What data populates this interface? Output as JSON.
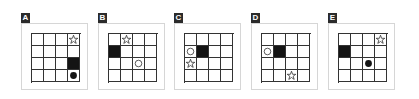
{
  "panels": [
    {
      "label": "A",
      "left": 21,
      "cells": [
        {
          "row": 0,
          "col": 3,
          "type": "star"
        },
        {
          "row": 2,
          "col": 3,
          "type": "black"
        },
        {
          "row": 3,
          "col": 3,
          "type": "dot"
        }
      ]
    },
    {
      "label": "B",
      "left": 98,
      "cells": [
        {
          "row": 0,
          "col": 1,
          "type": "star"
        },
        {
          "row": 1,
          "col": 0,
          "type": "black"
        },
        {
          "row": 2,
          "col": 2,
          "type": "circle"
        }
      ]
    },
    {
      "label": "C",
      "left": 174,
      "cells": [
        {
          "row": 1,
          "col": 0,
          "type": "circle"
        },
        {
          "row": 1,
          "col": 1,
          "type": "black"
        },
        {
          "row": 2,
          "col": 0,
          "type": "star"
        }
      ]
    },
    {
      "label": "D",
      "left": 251,
      "cells": [
        {
          "row": 1,
          "col": 0,
          "type": "circle"
        },
        {
          "row": 1,
          "col": 1,
          "type": "black"
        },
        {
          "row": 3,
          "col": 2,
          "type": "star"
        }
      ]
    },
    {
      "label": "E",
      "left": 328,
      "cells": [
        {
          "row": 0,
          "col": 3,
          "type": "star"
        },
        {
          "row": 1,
          "col": 0,
          "type": "black"
        },
        {
          "row": 2,
          "col": 2,
          "type": "dot"
        }
      ]
    }
  ],
  "grid": {
    "rows": 4,
    "cols": 4
  },
  "colors": {
    "line": "#333333",
    "fill": "#141414",
    "frame": "#d6d6d6",
    "label_bg": "#2b2b2b"
  }
}
